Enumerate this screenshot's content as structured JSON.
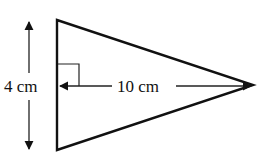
{
  "diagram": {
    "shape": "isosceles-triangle",
    "base_label": "4 cm",
    "height_label": "10 cm",
    "right_angle_marker": true,
    "colors": {
      "stroke": "#111111",
      "background": "#ffffff"
    }
  }
}
